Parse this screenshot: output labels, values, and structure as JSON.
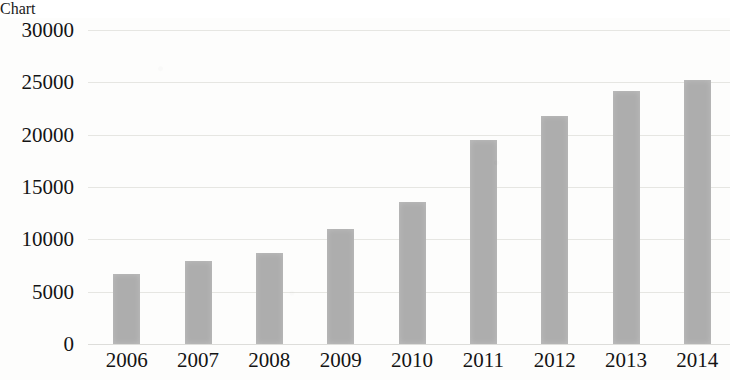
{
  "chart_data": {
    "type": "bar",
    "title": "",
    "subtitle": "",
    "xlabel": "",
    "ylabel": "",
    "categories": [
      "2006",
      "2007",
      "2008",
      "2009",
      "2010",
      "2011",
      "2012",
      "2013",
      "2014"
    ],
    "values": [
      6700,
      7900,
      8700,
      11000,
      13600,
      19500,
      21800,
      24200,
      25200
    ],
    "ylim": [
      0,
      30000
    ],
    "ytick_labels": [
      "30000",
      "25000",
      "20000",
      "15000",
      "10000",
      "5000",
      "0"
    ],
    "ytick_values": [
      30000,
      25000,
      20000,
      15000,
      10000,
      5000,
      0
    ],
    "grid": true,
    "legend": "none",
    "series": [
      {
        "name": "",
        "values": [
          6700,
          7900,
          8700,
          11000,
          13600,
          19500,
          21800,
          24200,
          25200
        ]
      }
    ],
    "bar_color": "#adadad",
    "grid_color": "#e6e6e2",
    "text_color": "#141414"
  }
}
